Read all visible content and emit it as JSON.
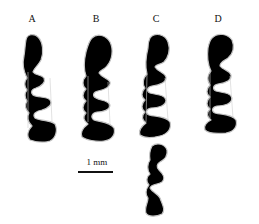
{
  "figure": {
    "panels": [
      {
        "label": "A",
        "x": 32
      },
      {
        "label": "B",
        "x": 96
      },
      {
        "label": "C",
        "x": 156
      },
      {
        "label": "D",
        "x": 218
      }
    ],
    "scale_bar": {
      "text": "1 mm"
    },
    "colors": {
      "fill": "#000000",
      "outline": "#bdbdbd",
      "background": "#ffffff"
    }
  }
}
